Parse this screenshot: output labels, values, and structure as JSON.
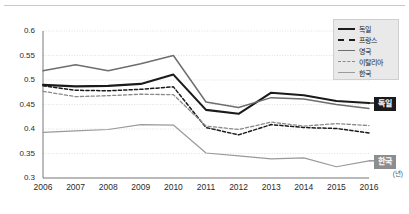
{
  "figure": {
    "unit_label": "(년)"
  },
  "legend": {
    "items": [
      {
        "label": "독일",
        "style": "solid-black-thick"
      },
      {
        "label": "프랑스",
        "style": "dashed-black"
      },
      {
        "label": "영국",
        "style": "solid-gray"
      },
      {
        "label": "이탈리아",
        "style": "dashed-gray"
      },
      {
        "label": "한국",
        "style": "solid-light-gray"
      }
    ]
  },
  "callouts": [
    {
      "name": "germany",
      "label": "독일",
      "value": 0.453,
      "bg": "#1a1a1a",
      "color": "#ffffff"
    },
    {
      "name": "korea",
      "label": "한국",
      "value": 0.335,
      "bg": "#8d8d8d",
      "color": "#ffffff"
    }
  ],
  "axis": {
    "y_ticks": [
      "0.6",
      "0.55",
      "0.5",
      "0.45",
      "0.4",
      "0.35",
      "0.3"
    ],
    "x_ticks": [
      "2006",
      "2007",
      "2008",
      "2009",
      "2010",
      "2011",
      "2012",
      "2013",
      "2014",
      "2015",
      "2016"
    ]
  },
  "colors": {
    "germany": "#1a1a1a",
    "france": "#1a1a1a",
    "uk": "#6e6e6e",
    "italy": "#8a8a8a",
    "korea": "#9a9a9a",
    "grid": "#d8d8d8",
    "axis": "#7a7a7a",
    "legend_bg": "#e9e9e9"
  },
  "chart_data": {
    "type": "line",
    "title": "",
    "xlabel": "(년)",
    "ylabel": "",
    "x": [
      2006,
      2007,
      2008,
      2009,
      2010,
      2011,
      2012,
      2013,
      2014,
      2015,
      2016
    ],
    "ylim": [
      0.3,
      0.6
    ],
    "yticks": [
      0.3,
      0.35,
      0.4,
      0.45,
      0.5,
      0.55,
      0.6
    ],
    "grid": "horizontal-dotted",
    "legend_position": "top-right",
    "series": [
      {
        "name": "독일",
        "key": "germany",
        "color": "#1a1a1a",
        "dash": "solid",
        "width": 2.1,
        "values": [
          0.49,
          0.487,
          0.488,
          0.492,
          0.511,
          0.439,
          0.431,
          0.474,
          0.469,
          0.457,
          0.453
        ]
      },
      {
        "name": "프랑스",
        "key": "france",
        "color": "#1a1a1a",
        "dash": "dashed",
        "width": 1.5,
        "values": [
          0.488,
          0.479,
          0.478,
          0.481,
          0.486,
          0.403,
          0.388,
          0.409,
          0.403,
          0.401,
          0.392
        ]
      },
      {
        "name": "영국",
        "key": "uk",
        "color": "#6e6e6e",
        "dash": "solid",
        "width": 1.5,
        "values": [
          0.519,
          0.531,
          0.519,
          0.533,
          0.55,
          0.455,
          0.444,
          0.464,
          0.461,
          0.45,
          0.442
        ]
      },
      {
        "name": "이탈리아",
        "key": "italy",
        "color": "#8a8a8a",
        "dash": "dashed",
        "width": 1.3,
        "values": [
          0.477,
          0.466,
          0.468,
          0.471,
          0.47,
          0.406,
          0.399,
          0.414,
          0.406,
          0.411,
          0.407
        ]
      },
      {
        "name": "한국",
        "key": "korea",
        "color": "#9a9a9a",
        "dash": "solid",
        "width": 1.2,
        "values": [
          0.393,
          0.396,
          0.399,
          0.409,
          0.408,
          0.351,
          0.345,
          0.339,
          0.341,
          0.323,
          0.335
        ]
      }
    ]
  }
}
